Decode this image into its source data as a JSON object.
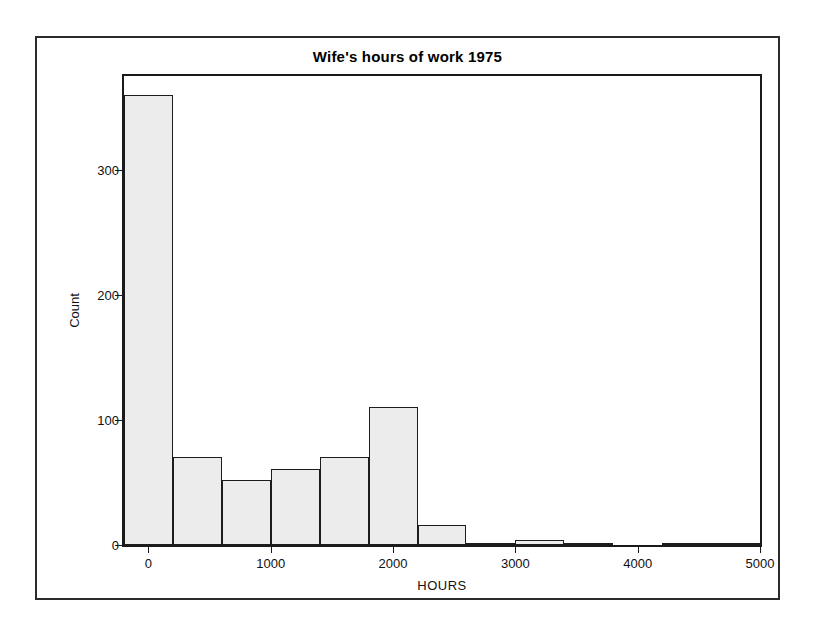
{
  "chart_data": {
    "type": "bar",
    "title": "Wife's hours of work 1975",
    "xlabel": "HOURS",
    "ylabel": "Count",
    "xlim": [
      -200,
      5000
    ],
    "ylim": [
      0,
      375
    ],
    "xticks": [
      0,
      1000,
      2000,
      3000,
      4000,
      5000
    ],
    "xtick_labels": [
      "0",
      "1000",
      "2000",
      "3000",
      "4000",
      "5000"
    ],
    "yticks": [
      0,
      100,
      200,
      300
    ],
    "ytick_labels": [
      "0",
      "100",
      "200",
      "300"
    ],
    "grid": false,
    "legend": false,
    "bin_width": 400,
    "bin_edges": [
      -200,
      200,
      600,
      1000,
      1400,
      1800,
      2200,
      2600,
      3000,
      3400,
      3800,
      4200,
      4600,
      5000
    ],
    "bin_centers": [
      0,
      400,
      800,
      1200,
      1600,
      2000,
      2400,
      2800,
      3200,
      3600,
      4000,
      4400,
      4800
    ],
    "categories": [
      "-200-200",
      "200-600",
      "600-1000",
      "1000-1400",
      "1400-1800",
      "1800-2200",
      "2200-2600",
      "2600-3000",
      "3000-3400",
      "3400-3800",
      "3800-4200",
      "4200-4600",
      "4600-5000"
    ],
    "values": [
      360,
      70,
      52,
      61,
      70,
      110,
      16,
      2,
      4,
      2,
      0,
      1,
      1
    ],
    "bar_fill_color": "#ececed",
    "bar_edge_color": "#1c1c1c",
    "frame_color": "#1a1a1a"
  }
}
